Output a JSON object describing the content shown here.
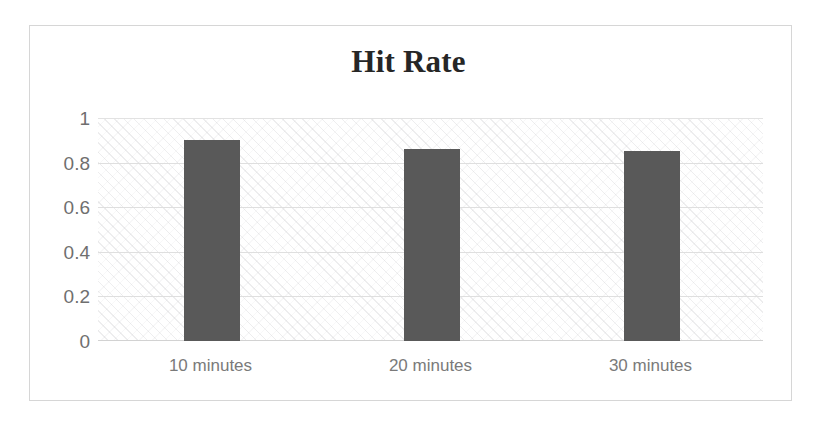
{
  "chart_data": {
    "type": "bar",
    "title": "Hit Rate",
    "xlabel": "",
    "ylabel": "",
    "categories": [
      "10 minutes",
      "20 minutes",
      "30 minutes"
    ],
    "values": [
      0.9,
      0.86,
      0.85
    ],
    "series": [
      {
        "name": "Hit Rate",
        "values": [
          0.9,
          0.86,
          0.85
        ]
      }
    ],
    "ylim": [
      0,
      1
    ],
    "ytick_labels": [
      "1",
      "0.8",
      "0.6",
      "0.4",
      "0.2",
      "0"
    ],
    "ytick_values": [
      1,
      0.8,
      0.6,
      0.4,
      0.2,
      0
    ],
    "grid": true,
    "legend": false,
    "legend_position": "none",
    "colors": {
      "bar_fill": "#595959",
      "gridline": "#dfdfdf",
      "title_text": "#262626",
      "axis_text": "#6f6f6f",
      "frame_border": "#d6d6d6",
      "plot_background": "#ffffff"
    }
  }
}
